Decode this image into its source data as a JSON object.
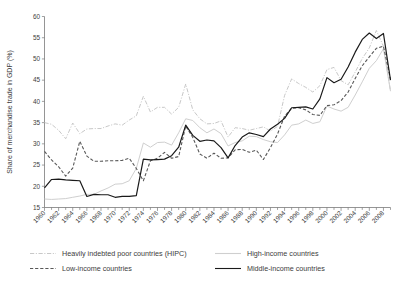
{
  "chart_data": {
    "type": "line",
    "title": "",
    "xlabel": "",
    "ylabel": "Share of merchandise trade in GDP (%)",
    "ylim": [
      15,
      60
    ],
    "xlim": [
      1960,
      2009
    ],
    "yticks": [
      15,
      20,
      25,
      30,
      35,
      40,
      45,
      50,
      55,
      60
    ],
    "ytick_labels": [
      "15",
      "20",
      "25",
      "30",
      "35",
      "40",
      "45",
      "50",
      "55",
      "60"
    ],
    "xticks": [
      1960,
      1962,
      1964,
      1966,
      1968,
      1970,
      1972,
      1974,
      1976,
      1978,
      1980,
      1982,
      1984,
      1986,
      1988,
      1990,
      1992,
      1994,
      1996,
      1998,
      2000,
      2002,
      2004,
      2006,
      2008
    ],
    "xtick_labels": [
      "1960",
      "1962",
      "1964",
      "1966",
      "1968",
      "1970",
      "1972",
      "1974",
      "1976",
      "1978",
      "1980",
      "1982",
      "1984",
      "1986",
      "1988",
      "1990",
      "1992",
      "1994",
      "1996",
      "1998",
      "2000",
      "2002",
      "2004",
      "2006",
      "2008"
    ],
    "xtick_minor_every": 1,
    "grid": false,
    "legend_position": "below",
    "x": [
      1960,
      1961,
      1962,
      1963,
      1964,
      1965,
      1966,
      1967,
      1968,
      1969,
      1970,
      1971,
      1972,
      1973,
      1974,
      1975,
      1976,
      1977,
      1978,
      1979,
      1980,
      1981,
      1982,
      1983,
      1984,
      1985,
      1986,
      1987,
      1988,
      1989,
      1990,
      1991,
      1992,
      1993,
      1994,
      1995,
      1996,
      1997,
      1998,
      1999,
      2000,
      2001,
      2002,
      2003,
      2004,
      2005,
      2006,
      2007,
      2008,
      2009
    ],
    "series": [
      {
        "name": "Heavily indebted poor countries (HIPC)",
        "color": "#c8c8c8",
        "style": "dashdot",
        "width": 1.0,
        "values": [
          35.0,
          34.6,
          33.2,
          31.2,
          34.9,
          32.4,
          33.5,
          33.6,
          33.6,
          34.2,
          34.7,
          34.4,
          35.6,
          36.6,
          41.2,
          37.5,
          38.6,
          38.6,
          37.0,
          38.6,
          44.1,
          38.0,
          35.9,
          34.7,
          34.8,
          35.4,
          31.6,
          33.8,
          33.6,
          33.2,
          33.6,
          34.0,
          33.0,
          34.1,
          41.4,
          45.3,
          44.2,
          43.3,
          42.2,
          43.7,
          47.5,
          48.0,
          44.9,
          43.9,
          46.9,
          50.1,
          52.6,
          56.7,
          53.0,
          42.5
        ]
      },
      {
        "name": "High-income countries",
        "color": "#cfcfcf",
        "style": "solid",
        "width": 1.0,
        "values": [
          17.0,
          16.9,
          17.0,
          17.1,
          17.4,
          17.7,
          18.1,
          18.1,
          18.9,
          19.6,
          20.5,
          20.6,
          21.3,
          24.2,
          30.2,
          29.2,
          30.3,
          30.4,
          29.7,
          32.6,
          35.9,
          35.5,
          33.8,
          32.6,
          33.5,
          32.4,
          29.5,
          30.3,
          30.7,
          31.8,
          31.7,
          31.0,
          30.5,
          30.3,
          32.1,
          34.4,
          34.7,
          35.6,
          34.8,
          35.2,
          38.9,
          38.2,
          37.7,
          38.6,
          41.5,
          44.6,
          47.8,
          49.6,
          52.4,
          42.4
        ]
      },
      {
        "name": "Low-income countries",
        "color": "#585858",
        "style": "dashed",
        "width": 1.1,
        "values": [
          28.2,
          26.2,
          24.6,
          22.4,
          24.3,
          30.6,
          27.1,
          25.9,
          25.9,
          26.0,
          26.0,
          26.1,
          26.6,
          24.2,
          21.3,
          26.0,
          26.6,
          28.0,
          26.6,
          27.0,
          34.2,
          31.5,
          27.6,
          26.6,
          27.8,
          26.6,
          26.7,
          28.6,
          28.7,
          28.0,
          28.5,
          26.3,
          29.1,
          32.3,
          36.5,
          38.4,
          38.5,
          38.0,
          36.9,
          36.7,
          39.0,
          39.2,
          40.2,
          42.2,
          45.4,
          48.4,
          50.5,
          52.5,
          53.0,
          45.2
        ]
      },
      {
        "name": "Middle-income countries",
        "color": "#1a1a1a",
        "style": "solid",
        "width": 1.2,
        "values": [
          19.6,
          21.6,
          21.7,
          21.5,
          21.4,
          21.3,
          17.6,
          18.1,
          18.0,
          18.0,
          17.4,
          17.6,
          17.6,
          17.8,
          26.4,
          26.2,
          26.3,
          26.4,
          27.2,
          29.2,
          34.4,
          32.0,
          30.6,
          30.9,
          30.7,
          29.1,
          26.7,
          29.6,
          31.6,
          32.6,
          32.2,
          31.7,
          33.5,
          34.6,
          36.0,
          38.5,
          38.6,
          38.7,
          38.2,
          40.6,
          45.6,
          44.4,
          45.2,
          48.1,
          51.6,
          54.6,
          56.1,
          54.8,
          56.0,
          45.0
        ]
      }
    ],
    "legend": [
      {
        "label": "Heavily indebted poor countries (HIPC)",
        "color": "#c8c8c8",
        "style": "dashdot"
      },
      {
        "label": "High-income countries",
        "color": "#cfcfcf",
        "style": "solid"
      },
      {
        "label": "Low-income countries",
        "color": "#585858",
        "style": "dashed"
      },
      {
        "label": "Middle-income countries",
        "color": "#1a1a1a",
        "style": "solid"
      }
    ]
  }
}
